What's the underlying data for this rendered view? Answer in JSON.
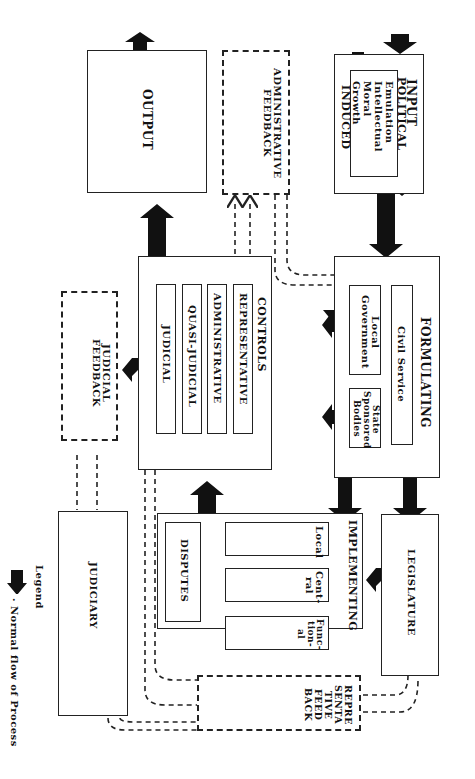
{
  "input": {
    "title": "INPUT",
    "subtitle": "POLITICAL",
    "inner": [
      "Emulation",
      "Intellectual",
      "Moral",
      "Growth"
    ],
    "induced": "INDUCED"
  },
  "formulating": {
    "title": "FORMULATING",
    "civil_service": "Civil Service",
    "local_government": "Local Government",
    "state_sponsored": "State Sponsored Bodies"
  },
  "output": {
    "title": "OUTPUT"
  },
  "admin_feedback": {
    "title": "ADMINISTRATIVE FEEDBACK"
  },
  "controls": {
    "title": "CONTROLS",
    "items": [
      "REPRESENTATIVE",
      "ADMINISTRATIVE",
      "QUASI-JUDICIAL",
      "JUDICIAL"
    ]
  },
  "judicial_feedback": {
    "title": "JUDICIAL FEEDBACK"
  },
  "implementing": {
    "title": "IMPLEMENTING",
    "items": [
      "Local",
      "Cent-ral",
      "Func-tion-al"
    ],
    "disputes": "DISPUTES"
  },
  "legislature": {
    "title": "LEGISLATURE"
  },
  "judiciary": {
    "title": "JUDICIARY"
  },
  "representative_feedback": {
    "title": "REPRE SENTA TIVE FEED BACK"
  },
  "legend": {
    "title": "Legend",
    "item": "· Normal flow of Process"
  }
}
